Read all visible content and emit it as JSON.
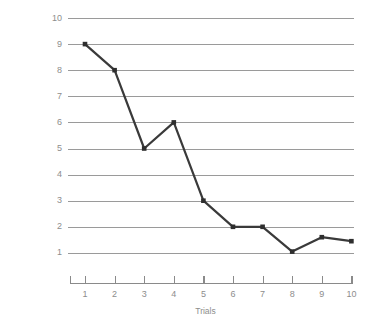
{
  "chart_data": {
    "type": "line",
    "title": "",
    "xlabel": "Trials",
    "ylabel": "Response Latency (in seconds)",
    "x": [
      1,
      2,
      3,
      4,
      5,
      6,
      7,
      8,
      9,
      10
    ],
    "values": [
      9,
      8,
      5,
      6,
      3,
      2,
      2,
      1.05,
      1.6,
      1.45
    ],
    "series": [
      {
        "name": "Response Latency",
        "values": [
          9,
          8,
          5,
          6,
          3,
          2,
          2,
          1.05,
          1.6,
          1.45
        ]
      }
    ],
    "xtick_labels": [
      "1",
      "2",
      "3",
      "4",
      "5",
      "6",
      "7",
      "8",
      "9",
      "10"
    ],
    "ytick_labels": [
      "10",
      "9",
      "8",
      "7",
      "6",
      "5",
      "4",
      "3",
      "2",
      "1"
    ],
    "ytick_values": [
      10,
      9,
      8,
      7,
      6,
      5,
      4,
      3,
      2,
      1
    ],
    "xlim": [
      0.5,
      10.5
    ],
    "ylim": [
      0.5,
      10.4
    ],
    "grid": "horizontal",
    "legend": "none",
    "marker": "square",
    "colors": {
      "line": "#3a3a3a",
      "marker": "#2e2e2e",
      "gridline": "#9a9a9a",
      "axis": "#8a8a8a",
      "tick_text": "#8d8d8d",
      "axis_label": "#8d8d8d",
      "background": "#ffffff"
    }
  }
}
